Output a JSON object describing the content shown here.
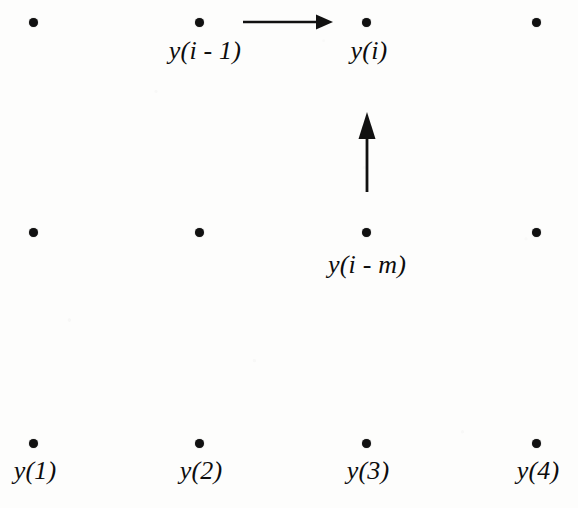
{
  "figure": {
    "width": 578,
    "height": 508,
    "background_color": "#fdfdfc",
    "ink_color": "#111111"
  },
  "grid": {
    "columns_x": [
      33,
      199,
      366,
      536
    ],
    "rows_y": [
      22,
      232,
      443
    ],
    "dot_diameter": 9,
    "dot_count": 12
  },
  "nodes": [
    {
      "id": "r1c1",
      "x": 33,
      "y": 22,
      "label": ""
    },
    {
      "id": "r1c2",
      "x": 199,
      "y": 22,
      "label": "y(i - 1)"
    },
    {
      "id": "r1c3",
      "x": 366,
      "y": 22,
      "label": "y(i)"
    },
    {
      "id": "r1c4",
      "x": 536,
      "y": 22,
      "label": ""
    },
    {
      "id": "r2c1",
      "x": 33,
      "y": 232,
      "label": ""
    },
    {
      "id": "r2c2",
      "x": 199,
      "y": 232,
      "label": ""
    },
    {
      "id": "r2c3",
      "x": 366,
      "y": 232,
      "label": "y(i - m)"
    },
    {
      "id": "r2c4",
      "x": 536,
      "y": 232,
      "label": ""
    },
    {
      "id": "r3c1",
      "x": 33,
      "y": 443,
      "label": "y(1)"
    },
    {
      "id": "r3c2",
      "x": 199,
      "y": 443,
      "label": "y(2)"
    },
    {
      "id": "r3c3",
      "x": 366,
      "y": 443,
      "label": "y(3)"
    },
    {
      "id": "r3c4",
      "x": 536,
      "y": 443,
      "label": "y(4)"
    }
  ],
  "labels": {
    "y_i_minus_1": "y(i - 1)",
    "y_i": "y(i)",
    "y_i_minus_m": "y(i - m)",
    "y_1": "y(1)",
    "y_2": "y(2)",
    "y_3": "y(3)",
    "y_4": "y(4)"
  },
  "arrows": [
    {
      "id": "horizontal-arrow",
      "direction": "right",
      "from_node": "r1c2",
      "to_node": "r1c3",
      "x1": 243,
      "y1": 22,
      "x2": 332,
      "y2": 22,
      "meaning": "y(i - 1) to y(i)"
    },
    {
      "id": "vertical-arrow",
      "direction": "up",
      "from_node": "r2c3",
      "to_node": "r1c3",
      "x1": 367,
      "y1": 192,
      "x2": 367,
      "y2": 113,
      "meaning": "y(i - m) to y(i)"
    }
  ]
}
